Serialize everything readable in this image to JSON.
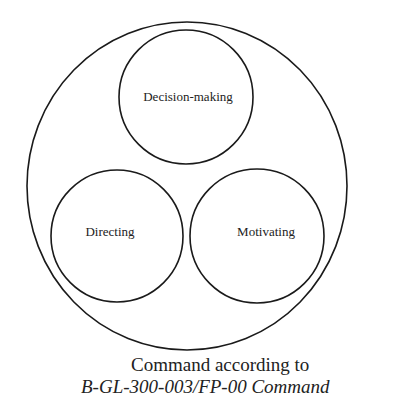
{
  "diagram": {
    "outer": {
      "label": ""
    },
    "circles": [
      {
        "id": "decision-making",
        "label": "Decision-making"
      },
      {
        "id": "directing",
        "label": "Directing"
      },
      {
        "id": "motivating",
        "label": "Motivating"
      }
    ],
    "caption": {
      "line1": "Command according to",
      "line2": "B-GL-300-003/FP-00  Command"
    },
    "colors": {
      "stroke": "#1a1a1a",
      "background": "#ffffff",
      "text": "#222222"
    }
  }
}
